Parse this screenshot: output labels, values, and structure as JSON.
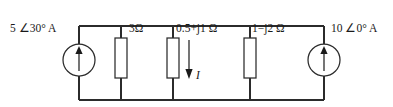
{
  "diagram": {
    "type": "electrical-circuit-schematic",
    "background_color": "#ffffff",
    "line_color": "#2b2b2b",
    "text_color": "#1a1a1a",
    "labels": {
      "source_left": "5 ∠30° A",
      "resistor_1": "3Ω",
      "impedance_2": "0.5+j1 Ω",
      "impedance_3": "1−j2 Ω",
      "source_right": "10 ∠0° A",
      "current_arrow": "I"
    },
    "components": [
      {
        "name": "current-source-left",
        "kind": "current-source",
        "label": "5 ∠30° A",
        "direction": "up"
      },
      {
        "name": "resistor-3-ohm",
        "kind": "resistor",
        "label": "3Ω"
      },
      {
        "name": "impedance-0p5-plus-j1",
        "kind": "impedance",
        "label": "0.5+j1 Ω"
      },
      {
        "name": "impedance-1-minus-j2",
        "kind": "impedance",
        "label": "1−j2 Ω"
      },
      {
        "name": "current-source-right",
        "kind": "current-source",
        "label": "10 ∠0° A",
        "direction": "up"
      }
    ],
    "current_arrow": {
      "label": "I",
      "direction": "down"
    }
  }
}
